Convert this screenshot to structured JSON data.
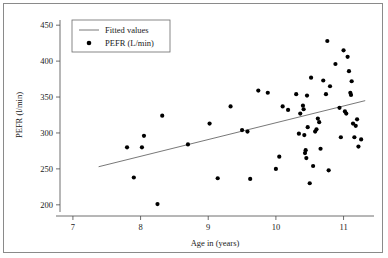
{
  "figure": {
    "border_color": "#8a8a8a",
    "background": "#ffffff"
  },
  "chart_data": {
    "type": "scatter",
    "title": "",
    "xlabel": "Age in (years)",
    "ylabel": "PEFR (l/min)",
    "xlim": [
      6.75,
      11.45
    ],
    "ylim": [
      190,
      460
    ],
    "xticks": [
      7,
      8,
      9,
      10,
      11
    ],
    "yticks": [
      200,
      250,
      300,
      350,
      400,
      450
    ],
    "xtick_labels": [
      "7",
      "8",
      "9",
      "10",
      "11"
    ],
    "ytick_labels": [
      "200",
      "250",
      "300",
      "350",
      "400",
      "450"
    ],
    "grid": false,
    "legend_position": "top-left",
    "legend": [
      {
        "label": "Fitted values",
        "marker": "line",
        "color": "#555555"
      },
      {
        "label": "PEFR (L/min)",
        "marker": "circle",
        "color": "#000000"
      }
    ],
    "series": [
      {
        "name": "PEFR (L/min)",
        "marker": "circle",
        "color": "#000000",
        "points": [
          [
            7.8,
            280
          ],
          [
            7.9,
            238
          ],
          [
            8.02,
            280
          ],
          [
            8.05,
            296
          ],
          [
            8.25,
            201
          ],
          [
            8.32,
            324
          ],
          [
            8.7,
            284
          ],
          [
            9.02,
            313
          ],
          [
            9.14,
            237
          ],
          [
            9.33,
            337
          ],
          [
            9.5,
            304
          ],
          [
            9.58,
            302
          ],
          [
            9.62,
            236
          ],
          [
            9.74,
            359
          ],
          [
            9.88,
            356
          ],
          [
            10.0,
            250
          ],
          [
            10.05,
            267
          ],
          [
            10.1,
            337
          ],
          [
            10.18,
            332
          ],
          [
            10.3,
            354
          ],
          [
            10.34,
            299
          ],
          [
            10.36,
            327
          ],
          [
            10.4,
            338
          ],
          [
            10.41,
            333
          ],
          [
            10.42,
            297
          ],
          [
            10.43,
            272
          ],
          [
            10.44,
            276
          ],
          [
            10.45,
            265
          ],
          [
            10.46,
            352
          ],
          [
            10.47,
            308
          ],
          [
            10.5,
            230
          ],
          [
            10.52,
            377
          ],
          [
            10.55,
            254
          ],
          [
            10.58,
            302
          ],
          [
            10.6,
            305
          ],
          [
            10.62,
            320
          ],
          [
            10.64,
            315
          ],
          [
            10.66,
            278
          ],
          [
            10.7,
            373
          ],
          [
            10.74,
            354
          ],
          [
            10.76,
            428
          ],
          [
            10.78,
            248
          ],
          [
            10.8,
            365
          ],
          [
            10.88,
            396
          ],
          [
            10.94,
            335
          ],
          [
            10.96,
            294
          ],
          [
            11.0,
            415
          ],
          [
            11.02,
            330
          ],
          [
            11.04,
            327
          ],
          [
            11.06,
            406
          ],
          [
            11.08,
            386
          ],
          [
            11.1,
            356
          ],
          [
            11.11,
            353
          ],
          [
            11.12,
            372
          ],
          [
            11.14,
            313
          ],
          [
            11.16,
            294
          ],
          [
            11.18,
            310
          ],
          [
            11.2,
            319
          ],
          [
            11.22,
            281
          ],
          [
            11.26,
            291
          ]
        ]
      }
    ],
    "fit_line": {
      "name": "Fitted values",
      "color": "#555555",
      "x": [
        7.38,
        11.32
      ],
      "y": [
        253,
        345
      ]
    }
  }
}
